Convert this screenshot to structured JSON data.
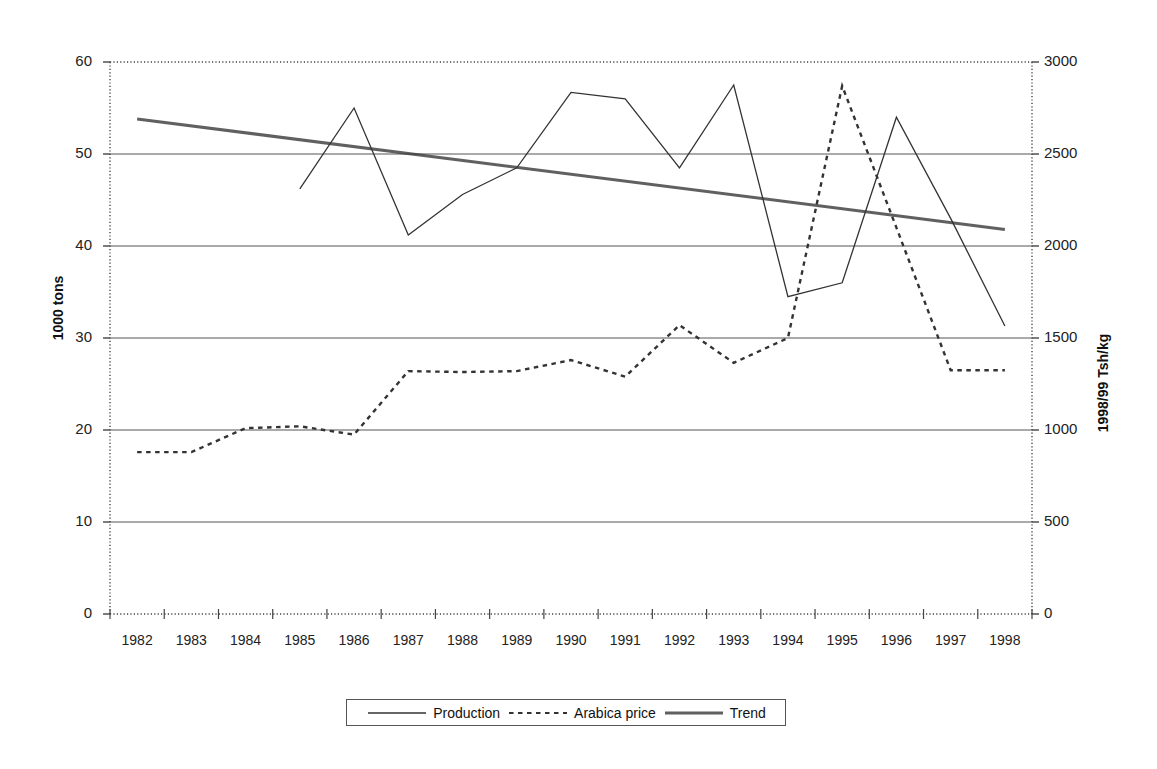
{
  "chart_data": {
    "type": "line",
    "title": "",
    "xlabel": "",
    "ylabel": "1000 tons",
    "y2label": "1998/99 Tsh/kg",
    "grid": true,
    "legend_position": "bottom",
    "categories": [
      "1982",
      "1983",
      "1984",
      "1985",
      "1986",
      "1987",
      "1988",
      "1989",
      "1990",
      "1991",
      "1992",
      "1993",
      "1994",
      "1995",
      "1996",
      "1997",
      "1998"
    ],
    "ylim": [
      0,
      60
    ],
    "y2lim": [
      0,
      3000
    ],
    "yticks": [
      "0",
      "10",
      "20",
      "30",
      "40",
      "50",
      "60"
    ],
    "y2ticks": [
      "0",
      "500",
      "1000",
      "1500",
      "2000",
      "2500",
      "3000"
    ],
    "series": [
      {
        "name": "Production",
        "axis": "left",
        "style": "solid-thin",
        "values": [
          null,
          null,
          null,
          46.2,
          55.0,
          41.2,
          45.6,
          48.5,
          56.7,
          56.0,
          48.5,
          57.5,
          34.5,
          36.0,
          54.0,
          43.0,
          31.3
        ]
      },
      {
        "name": "Arabica price",
        "axis": "right",
        "style": "dashed",
        "values_left_scale": [
          17.6,
          17.6,
          20.2,
          20.4,
          19.5,
          26.4,
          26.3,
          26.4,
          27.6,
          25.8,
          31.4,
          27.3,
          30.0,
          57.4,
          42.0,
          26.5,
          26.5
        ],
        "values": [
          880,
          880,
          1010,
          1020,
          975,
          1320,
          1315,
          1320,
          1380,
          1290,
          1570,
          1365,
          1500,
          2870,
          2100,
          1325,
          1325
        ]
      },
      {
        "name": "Trend",
        "axis": "left",
        "style": "solid-thick",
        "values": [
          53.8,
          null,
          null,
          null,
          null,
          null,
          null,
          null,
          null,
          null,
          null,
          null,
          null,
          null,
          null,
          null,
          41.8
        ],
        "endpoints": [
          53.8,
          41.8
        ]
      }
    ]
  },
  "legend": {
    "items": [
      {
        "label": "Production",
        "style": "solid-thin"
      },
      {
        "label": "Arabica price",
        "style": "dashed"
      },
      {
        "label": "Trend",
        "style": "solid-thick"
      }
    ]
  },
  "colors": {
    "line": "#333333",
    "grid": "#555555",
    "axis": "#444444",
    "text": "#111111",
    "background": "#ffffff"
  }
}
